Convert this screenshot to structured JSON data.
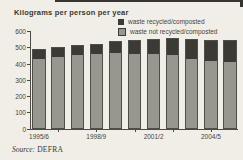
{
  "page": {
    "title": "Kilograms per person per year",
    "source_prefix": "Source:",
    "source_value": "DEFRA"
  },
  "legend": [
    {
      "label": "waste recycled/composted",
      "color": "#3b3a35",
      "bordered": false
    },
    {
      "label": "waste not recycled/composted",
      "color": "#98978f",
      "bordered": true
    }
  ],
  "chart_data": {
    "type": "bar",
    "stacked": true,
    "title": "Kilograms per person per year",
    "ylabel": "Kilograms per person per year",
    "xlabel": "",
    "ylim": [
      0,
      600
    ],
    "yticks": [
      0,
      100,
      200,
      300,
      400,
      500,
      600
    ],
    "grid": false,
    "legend_position": "top-right",
    "source": "DEFRA",
    "categories": [
      "1995/6",
      "1996/7",
      "1997/8",
      "1998/9",
      "1999/00",
      "2000/01",
      "2001/2",
      "2002/3",
      "2003/4",
      "2004/5",
      "2005/6"
    ],
    "series": [
      {
        "name": "waste recycled/composted",
        "color": "#3b3a35",
        "values": [
          50,
          55,
          55,
          60,
          65,
          80,
          90,
          100,
          115,
          120,
          130
        ]
      },
      {
        "name": "waste not recycled/composted",
        "color": "#98978f",
        "values": [
          440,
          450,
          460,
          465,
          475,
          470,
          465,
          460,
          440,
          425,
          420
        ]
      }
    ],
    "totals": [
      490,
      505,
      515,
      525,
      540,
      550,
      555,
      560,
      555,
      545,
      550
    ],
    "xtick_labels": [
      {
        "bar_index": 0,
        "label": "1995/6"
      },
      {
        "bar_index": 3,
        "label": "1998/9"
      },
      {
        "bar_index": 6,
        "label": "2001/2"
      },
      {
        "bar_index": 9,
        "label": "2004/5"
      }
    ],
    "xtick_marks_at": [
      1,
      3,
      5,
      7,
      9
    ]
  }
}
